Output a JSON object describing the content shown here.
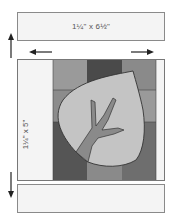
{
  "top_strip": {
    "label": "1¼\" x 6½\""
  },
  "side_strip": {
    "label": "1¼\" x 5\""
  },
  "bottom_strip": {
    "label": ""
  },
  "arrows": {
    "up": "arrow-up",
    "down": "arrow-down",
    "left": "arrow-left",
    "right": "arrow-right"
  },
  "colors": {
    "strip": "#f4f4f4",
    "light_gray": "#9a9a9a",
    "mid_gray": "#7d7d7d",
    "dark_gray": "#4a4a4a",
    "leaf": "#c4c4c4",
    "stem": "#8a8a8a",
    "outline": "#333333"
  }
}
